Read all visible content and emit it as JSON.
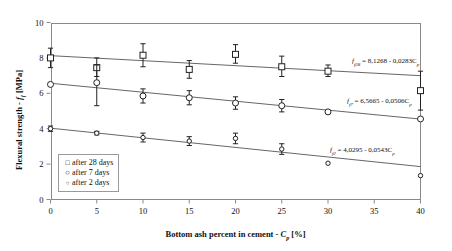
{
  "chart_data": {
    "type": "scatter",
    "title": "",
    "xlabel": "Bottom ash percent in cement - Cp [%]",
    "ylabel": "Flexural strength - ff [MPa]",
    "xlim": [
      0,
      40
    ],
    "ylim": [
      0,
      10
    ],
    "xticks": [
      0,
      5,
      10,
      15,
      20,
      25,
      30,
      35,
      40
    ],
    "yticks": [
      0,
      2,
      4,
      6,
      8,
      10
    ],
    "grid": false,
    "legend_position": "bottom-left",
    "series": [
      {
        "name": "after 28 days",
        "marker": "open-square",
        "x": [
          0,
          5,
          10,
          15,
          20,
          25,
          30,
          40
        ],
        "values": [
          8.0,
          7.45,
          8.15,
          7.35,
          8.2,
          7.5,
          7.25,
          6.15
        ],
        "err_low": [
          0.55,
          0.5,
          0.65,
          0.5,
          0.5,
          0.55,
          0.3,
          1.1
        ],
        "err_high": [
          0.55,
          0.55,
          0.65,
          0.5,
          0.55,
          0.6,
          0.35,
          1.1
        ],
        "fit": {
          "intercept": 8.1268,
          "slope": -0.0283
        },
        "equation": "ff28 = 8,1268 - 0,0283Cp"
      },
      {
        "name": "after 7 days",
        "marker": "open-circle",
        "x": [
          0,
          5,
          10,
          15,
          20,
          25,
          30,
          40
        ],
        "values": [
          6.5,
          6.6,
          5.85,
          5.75,
          5.45,
          5.3,
          4.95,
          4.55
        ],
        "err_low": [
          0.0,
          1.3,
          0.4,
          0.4,
          0.35,
          0.35,
          0.0,
          0.0
        ],
        "err_high": [
          0.0,
          1.0,
          0.4,
          0.4,
          0.35,
          0.35,
          0.0,
          0.0
        ],
        "fit": {
          "intercept": 6.5665,
          "slope": -0.0506
        },
        "equation": "ff7 = 6,5665 - 0,0506Cp"
      },
      {
        "name": "after 2 days",
        "marker": "small-circle",
        "x": [
          0,
          5,
          10,
          15,
          20,
          25,
          30,
          40
        ],
        "values": [
          4.0,
          3.75,
          3.5,
          3.3,
          3.45,
          2.85,
          2.05,
          1.35
        ],
        "err_low": [
          0.15,
          0.1,
          0.25,
          0.25,
          0.3,
          0.3,
          0.0,
          0.0
        ],
        "err_high": [
          0.15,
          0.1,
          0.25,
          0.25,
          0.3,
          0.3,
          0.0,
          0.0
        ],
        "fit": {
          "intercept": 4.0295,
          "slope": -0.0543
        },
        "equation": "ff2 = 4,0295 - 0,0543Cp"
      }
    ]
  },
  "axes": {
    "y_title_main": "Flexural strength - ",
    "y_title_sym": "f",
    "y_title_sub": "f",
    "y_title_unit": " [MPa]",
    "x_title_main": "Bottom ash percent in cement - ",
    "x_title_sym": "C",
    "x_title_sub": "p",
    "x_title_unit": " [%]",
    "xticks": [
      "0",
      "5",
      "10",
      "15",
      "20",
      "25",
      "30",
      "35",
      "40"
    ],
    "yticks": [
      "0",
      "2",
      "4",
      "6",
      "8",
      "10"
    ]
  },
  "legend": {
    "items": [
      {
        "marker": "□",
        "label": "after 28 days"
      },
      {
        "marker": "○",
        "label": "after 7 days"
      },
      {
        "marker": "○",
        "label": "after 2 days"
      }
    ]
  },
  "equations": [
    {
      "sym": "f",
      "sub": "f28",
      "body": "= 8,1268 - 0,0283C",
      "tail": "p"
    },
    {
      "sym": "f",
      "sub": "f7",
      "body": "= 6,5665 - 0,0506C",
      "tail": "p"
    },
    {
      "sym": "f",
      "sub": "f2",
      "body": "= 4,0295 - 0,0543C",
      "tail": "p"
    }
  ]
}
